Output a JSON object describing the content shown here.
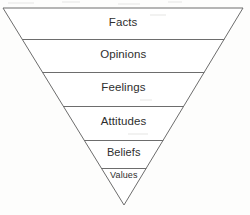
{
  "diagram": {
    "type": "inverted-triangle",
    "title": "",
    "shape": {
      "top_left_x": 3,
      "top_right_x": 243,
      "top_y": 8,
      "apex_x": 124,
      "apex_y": 205
    },
    "style": {
      "line_color": "#6d6d6d",
      "background_color": "#fdfdfc",
      "text_color": "#2e2e2e",
      "fill_color": "#ffffff"
    },
    "bands": [
      {
        "label": "Facts",
        "divider_y": 39,
        "label_y": 17,
        "font_size": 11.5
      },
      {
        "label": "Opinions",
        "divider_y": 72,
        "label_y": 49,
        "font_size": 11.5
      },
      {
        "label": "Feelings",
        "divider_y": 106,
        "label_y": 82,
        "font_size": 11.5
      },
      {
        "label": "Attitudes",
        "divider_y": 140,
        "label_y": 116,
        "font_size": 11.5
      },
      {
        "label": "Beliefs",
        "divider_y": 168,
        "label_y": 147,
        "font_size": 11
      },
      {
        "label": "Values",
        "divider_y": null,
        "label_y": 171,
        "font_size": 9
      }
    ]
  }
}
